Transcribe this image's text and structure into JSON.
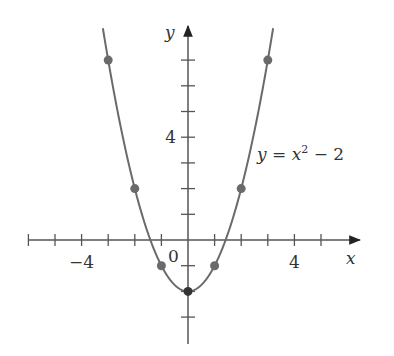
{
  "chart_data": {
    "type": "line",
    "title": "",
    "function": "y = x^2 - 2",
    "annotation": {
      "prefix": "y = x",
      "sup": "2",
      "suffix": " − 2"
    },
    "xlabel": "x",
    "ylabel": "y",
    "xlim": [
      -6,
      6.5
    ],
    "ylim": [
      -3,
      8.2
    ],
    "x_ticks": [
      -6,
      -5,
      -4,
      -3,
      -2,
      -1,
      1,
      2,
      3,
      4,
      5
    ],
    "y_ticks": [
      -3,
      -2,
      -1,
      1,
      2,
      3,
      4,
      5,
      6,
      7
    ],
    "x_tick_labels": [
      {
        "value": -4,
        "label": "−4"
      },
      {
        "value": 4,
        "label": "4"
      }
    ],
    "y_tick_labels": [
      {
        "value": 4,
        "label": "4"
      }
    ],
    "origin_label": "0",
    "grid": false,
    "points": [
      {
        "x": -3,
        "y": 7
      },
      {
        "x": -2,
        "y": 2
      },
      {
        "x": -1,
        "y": -1
      },
      {
        "x": 0,
        "y": -2
      },
      {
        "x": 1,
        "y": -1
      },
      {
        "x": 2,
        "y": 2
      },
      {
        "x": 3,
        "y": 7
      }
    ],
    "curve_x_range": [
      -3.2,
      3.2
    ],
    "colors": {
      "curve": "#6a6a6a",
      "points": "#6a6a6a",
      "vertex": "#333333",
      "axes": "#555555"
    }
  }
}
